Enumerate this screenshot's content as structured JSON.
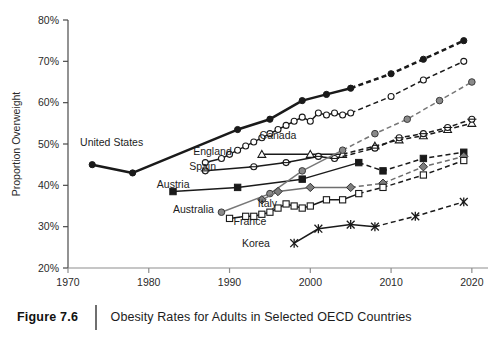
{
  "figure": {
    "number": "Figure 7.6",
    "title": "Obesity Rates for Adults in Selected OECD Countries"
  },
  "chart_data": {
    "type": "line",
    "title": "Obesity Rates for Adults in Selected OECD Countries",
    "xlabel": "Year",
    "ylabel": "Proportion Overweight",
    "xlim": [
      1970,
      2022
    ],
    "ylim": [
      20,
      80
    ],
    "xticks": [
      1970,
      1980,
      1990,
      2000,
      2010,
      2020
    ],
    "xtick_labels": [
      "1970",
      "1980",
      "1990",
      "2000",
      "2010",
      "2020"
    ],
    "yticks": [
      20,
      30,
      40,
      50,
      60,
      70,
      80
    ],
    "ytick_labels": [
      "20%",
      "30%",
      "40%",
      "50%",
      "60%",
      "70%",
      "80%"
    ],
    "grid": false,
    "legend": "inline-labels",
    "note": "Solid segments are observed data; dashed segments are projections.",
    "series": [
      {
        "name": "United States",
        "marker": "filled-circle",
        "color": "#1a1a1a",
        "label_x": 1971.5,
        "label_y": 49.6,
        "label_anchor": "start",
        "observed": [
          {
            "x": 1973,
            "y": 45.0
          },
          {
            "x": 1978,
            "y": 43.0
          },
          {
            "x": 1991,
            "y": 53.5
          },
          {
            "x": 1995,
            "y": 56.0
          },
          {
            "x": 1999,
            "y": 60.5
          },
          {
            "x": 2002,
            "y": 62.0
          },
          {
            "x": 2005,
            "y": 63.5
          }
        ],
        "projected": [
          {
            "x": 2005,
            "y": 63.5
          },
          {
            "x": 2010,
            "y": 67.0
          },
          {
            "x": 2014,
            "y": 70.5
          },
          {
            "x": 2019,
            "y": 75.0
          }
        ]
      },
      {
        "name": "England",
        "marker": "open-circle",
        "color": "#1a1a1a",
        "label_x": 1985.5,
        "label_y": 47.3,
        "label_anchor": "start",
        "observed": [
          {
            "x": 1987,
            "y": 45.5
          },
          {
            "x": 1989,
            "y": 46.5
          },
          {
            "x": 1990,
            "y": 47.5
          },
          {
            "x": 1991,
            "y": 48.5
          },
          {
            "x": 1992,
            "y": 49.5
          },
          {
            "x": 1993,
            "y": 50.5
          },
          {
            "x": 1994,
            "y": 51.5
          },
          {
            "x": 1995,
            "y": 52.5
          },
          {
            "x": 1996,
            "y": 53.5
          },
          {
            "x": 1997,
            "y": 54.5
          },
          {
            "x": 1998,
            "y": 55.5
          },
          {
            "x": 1999,
            "y": 56.5
          },
          {
            "x": 2000,
            "y": 55.5
          },
          {
            "x": 2001,
            "y": 57.5
          },
          {
            "x": 2002,
            "y": 57.0
          },
          {
            "x": 2003,
            "y": 57.5
          },
          {
            "x": 2004,
            "y": 57.0
          },
          {
            "x": 2005,
            "y": 57.5
          }
        ],
        "projected": [
          {
            "x": 2005,
            "y": 57.5
          },
          {
            "x": 2010,
            "y": 61.5
          },
          {
            "x": 2014,
            "y": 65.5
          },
          {
            "x": 2019,
            "y": 70.0
          }
        ]
      },
      {
        "name": "Canada",
        "marker": "open-triangle",
        "color": "#1a1a1a",
        "label_x": 1996.0,
        "label_y": 51.2,
        "label_anchor": "middle",
        "observed": [
          {
            "x": 1994,
            "y": 47.5
          },
          {
            "x": 2000,
            "y": 47.5
          },
          {
            "x": 2004,
            "y": 47.5
          }
        ],
        "projected": [
          {
            "x": 2004,
            "y": 47.5
          },
          {
            "x": 2008,
            "y": 49.5
          },
          {
            "x": 2011,
            "y": 51.0
          },
          {
            "x": 2014,
            "y": 52.0
          },
          {
            "x": 2017,
            "y": 53.5
          },
          {
            "x": 2020,
            "y": 55.0
          }
        ]
      },
      {
        "name": "Spain",
        "marker": "circle-dot",
        "color": "#1a1a1a",
        "label_x": 1985.0,
        "label_y": 43.8,
        "label_anchor": "start",
        "observed": [
          {
            "x": 1987,
            "y": 43.5
          },
          {
            "x": 1993,
            "y": 44.5
          },
          {
            "x": 1997,
            "y": 45.5
          },
          {
            "x": 2001,
            "y": 47.0
          },
          {
            "x": 2003,
            "y": 46.5
          }
        ],
        "projected": [
          {
            "x": 2003,
            "y": 46.5
          },
          {
            "x": 2008,
            "y": 49.0
          },
          {
            "x": 2011,
            "y": 51.5
          },
          {
            "x": 2014,
            "y": 52.5
          },
          {
            "x": 2017,
            "y": 54.0
          },
          {
            "x": 2020,
            "y": 56.0
          }
        ]
      },
      {
        "name": "Austria",
        "marker": "filled-square",
        "color": "#1a1a1a",
        "label_x": 1981.0,
        "label_y": 39.3,
        "label_anchor": "start",
        "observed": [
          {
            "x": 1983,
            "y": 38.5
          },
          {
            "x": 1991,
            "y": 39.5
          },
          {
            "x": 1999,
            "y": 41.5
          },
          {
            "x": 2006,
            "y": 45.5
          }
        ],
        "projected": [
          {
            "x": 2006,
            "y": 45.5
          },
          {
            "x": 2009,
            "y": 43.5
          },
          {
            "x": 2014,
            "y": 46.5
          },
          {
            "x": 2019,
            "y": 48.0
          }
        ]
      },
      {
        "name": "Australia",
        "marker": "gray-circle",
        "color": "#777777",
        "label_x": 1983.0,
        "label_y": 33.2,
        "label_anchor": "start",
        "observed": [
          {
            "x": 1989,
            "y": 33.5
          },
          {
            "x": 1995,
            "y": 38.0
          },
          {
            "x": 1999,
            "y": 43.5
          },
          {
            "x": 2004,
            "y": 48.5
          }
        ],
        "projected": [
          {
            "x": 2004,
            "y": 48.5
          },
          {
            "x": 2008,
            "y": 52.5
          },
          {
            "x": 2012,
            "y": 56.0
          },
          {
            "x": 2016,
            "y": 60.5
          },
          {
            "x": 2020,
            "y": 65.0
          }
        ]
      },
      {
        "name": "Italy",
        "marker": "gray-diamond",
        "color": "#6e6e6e",
        "label_x": 1993.5,
        "label_y": 34.8,
        "label_anchor": "start",
        "observed": [
          {
            "x": 1994,
            "y": 36.5
          },
          {
            "x": 1996,
            "y": 38.5
          },
          {
            "x": 2000,
            "y": 39.5
          },
          {
            "x": 2005,
            "y": 39.5
          }
        ],
        "projected": [
          {
            "x": 2005,
            "y": 39.5
          },
          {
            "x": 2009,
            "y": 40.5
          },
          {
            "x": 2014,
            "y": 44.5
          },
          {
            "x": 2019,
            "y": 47.0
          }
        ]
      },
      {
        "name": "France",
        "marker": "open-square",
        "color": "#1a1a1a",
        "label_x": 1990.5,
        "label_y": 30.5,
        "label_anchor": "start",
        "observed": [
          {
            "x": 1990,
            "y": 32.0
          },
          {
            "x": 1992,
            "y": 32.5
          },
          {
            "x": 1993,
            "y": 32.5
          },
          {
            "x": 1994,
            "y": 33.0
          },
          {
            "x": 1995,
            "y": 33.5
          },
          {
            "x": 1996,
            "y": 34.5
          },
          {
            "x": 1997,
            "y": 35.5
          },
          {
            "x": 1998,
            "y": 35.0
          },
          {
            "x": 1999,
            "y": 34.5
          },
          {
            "x": 2000,
            "y": 35.0
          },
          {
            "x": 2002,
            "y": 36.5
          },
          {
            "x": 2004,
            "y": 36.5
          },
          {
            "x": 2006,
            "y": 38.0
          }
        ],
        "projected": [
          {
            "x": 2006,
            "y": 38.0
          },
          {
            "x": 2009,
            "y": 39.5
          },
          {
            "x": 2014,
            "y": 42.5
          },
          {
            "x": 2019,
            "y": 46.0
          }
        ]
      },
      {
        "name": "Korea",
        "marker": "asterisk",
        "color": "#1a1a1a",
        "label_x": 1995.0,
        "label_y": 25.2,
        "label_anchor": "end",
        "observed": [
          {
            "x": 1998,
            "y": 26.0
          },
          {
            "x": 2001,
            "y": 29.5
          },
          {
            "x": 2005,
            "y": 30.5
          },
          {
            "x": 2008,
            "y": 30.0
          }
        ],
        "projected": [
          {
            "x": 2008,
            "y": 30.0
          },
          {
            "x": 2013,
            "y": 32.5
          },
          {
            "x": 2019,
            "y": 36.0
          }
        ]
      }
    ]
  }
}
